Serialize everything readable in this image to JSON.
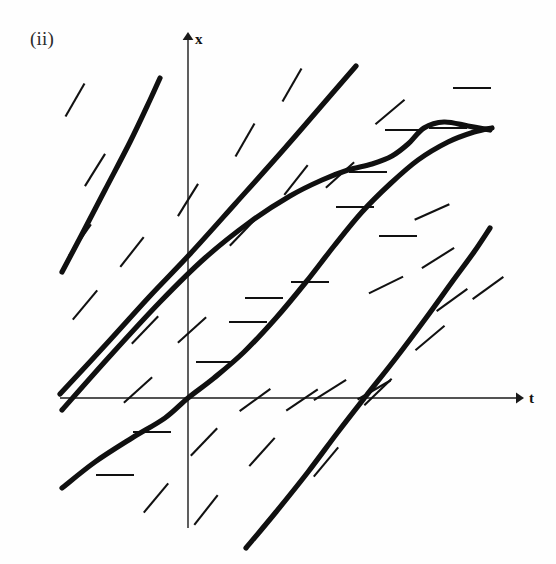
{
  "figure": {
    "panel_label": "(ii)",
    "type": "direction-field-with-solution-curves",
    "background_color": "#fefefe",
    "ink_color": "#111111"
  },
  "axes": {
    "horizontal": {
      "label": "t",
      "label_x": 530,
      "label_y": 402,
      "y_pixel": 398,
      "x_start": 60,
      "x_end": 520,
      "arrow": "right"
    },
    "vertical": {
      "label": "x",
      "label_x": 196,
      "label_y": 42,
      "x_pixel": 188,
      "y_start": 528,
      "y_end": 34,
      "arrow": "up"
    }
  },
  "chart_data": {
    "type": "line",
    "title": "(ii)",
    "xlabel": "t",
    "ylabel": "x",
    "grid": false,
    "legend": false,
    "axis_origin_pixel": [
      188,
      398
    ],
    "slope_marks": [
      {
        "x": 75,
        "y": 100,
        "angle": -60
      },
      {
        "x": 95,
        "y": 170,
        "angle": -58
      },
      {
        "x": 80,
        "y": 240,
        "angle": -55
      },
      {
        "x": 132,
        "y": 252,
        "angle": -52
      },
      {
        "x": 85,
        "y": 305,
        "angle": -50
      },
      {
        "x": 145,
        "y": 330,
        "angle": -46
      },
      {
        "x": 138,
        "y": 390,
        "angle": -42
      },
      {
        "x": 192,
        "y": 330,
        "angle": -42
      },
      {
        "x": 188,
        "y": 200,
        "angle": -58
      },
      {
        "x": 245,
        "y": 140,
        "angle": -60
      },
      {
        "x": 292,
        "y": 85,
        "angle": -60
      },
      {
        "x": 243,
        "y": 232,
        "angle": -46
      },
      {
        "x": 296,
        "y": 180,
        "angle": -52
      },
      {
        "x": 340,
        "y": 175,
        "angle": -42
      },
      {
        "x": 255,
        "y": 400,
        "angle": -36
      },
      {
        "x": 302,
        "y": 400,
        "angle": -34
      },
      {
        "x": 330,
        "y": 390,
        "angle": -32
      },
      {
        "x": 374,
        "y": 390,
        "angle": -30
      },
      {
        "x": 390,
        "y": 112,
        "angle": -40
      },
      {
        "x": 398,
        "y": 236,
        "angle": 0
      },
      {
        "x": 310,
        "y": 282,
        "angle": 0
      },
      {
        "x": 248,
        "y": 322,
        "angle": 0
      },
      {
        "x": 215,
        "y": 362,
        "angle": 0
      },
      {
        "x": 368,
        "y": 172,
        "angle": 0
      },
      {
        "x": 404,
        "y": 130,
        "angle": 0
      },
      {
        "x": 472,
        "y": 88,
        "angle": 0
      },
      {
        "x": 448,
        "y": 128,
        "angle": 0
      },
      {
        "x": 152,
        "y": 432,
        "angle": 0
      },
      {
        "x": 115,
        "y": 475,
        "angle": 0
      },
      {
        "x": 355,
        "y": 207,
        "angle": 0
      },
      {
        "x": 432,
        "y": 212,
        "angle": -24
      },
      {
        "x": 386,
        "y": 285,
        "angle": -26
      },
      {
        "x": 438,
        "y": 258,
        "angle": -32
      },
      {
        "x": 452,
        "y": 300,
        "angle": -36
      },
      {
        "x": 488,
        "y": 288,
        "angle": -36
      },
      {
        "x": 430,
        "y": 338,
        "angle": -40
      },
      {
        "x": 378,
        "y": 392,
        "angle": -44
      },
      {
        "x": 204,
        "y": 442,
        "angle": -46
      },
      {
        "x": 262,
        "y": 452,
        "angle": -48
      },
      {
        "x": 156,
        "y": 498,
        "angle": -50
      },
      {
        "x": 206,
        "y": 510,
        "angle": -52
      },
      {
        "x": 326,
        "y": 462,
        "angle": -50
      },
      {
        "x": 264,
        "y": 298,
        "angle": 0
      }
    ],
    "solution_curves": [
      {
        "name": "curve-1-far-left",
        "points": [
          [
            62,
            272
          ],
          [
            80,
            238
          ],
          [
            105,
            190
          ],
          [
            130,
            142
          ],
          [
            150,
            100
          ],
          [
            160,
            78
          ]
        ]
      },
      {
        "name": "curve-2-left-through-upper",
        "points": [
          [
            60,
            394
          ],
          [
            110,
            340
          ],
          [
            150,
            296
          ],
          [
            190,
            254
          ],
          [
            235,
            204
          ],
          [
            285,
            148
          ],
          [
            330,
            96
          ],
          [
            356,
            66
          ]
        ]
      },
      {
        "name": "curve-3-s-shaped-middle",
        "points": [
          [
            62,
            410
          ],
          [
            110,
            356
          ],
          [
            160,
            302
          ],
          [
            205,
            258
          ],
          [
            250,
            222
          ],
          [
            290,
            196
          ],
          [
            322,
            180
          ],
          [
            348,
            170
          ],
          [
            372,
            164
          ],
          [
            392,
            156
          ],
          [
            408,
            144
          ],
          [
            424,
            128
          ],
          [
            444,
            122
          ],
          [
            468,
            126
          ],
          [
            490,
            130
          ]
        ]
      },
      {
        "name": "curve-4-through-origin",
        "points": [
          [
            62,
            488
          ],
          [
            95,
            462
          ],
          [
            132,
            438
          ],
          [
            165,
            418
          ],
          [
            188,
            398
          ],
          [
            214,
            378
          ],
          [
            244,
            352
          ],
          [
            276,
            318
          ],
          [
            306,
            282
          ],
          [
            334,
            246
          ],
          [
            362,
            212
          ],
          [
            390,
            184
          ],
          [
            418,
            160
          ],
          [
            448,
            142
          ],
          [
            474,
            132
          ],
          [
            492,
            128
          ]
        ]
      },
      {
        "name": "curve-5-lower-right",
        "points": [
          [
            246,
            548
          ],
          [
            276,
            512
          ],
          [
            308,
            472
          ],
          [
            338,
            432
          ],
          [
            366,
            396
          ],
          [
            396,
            358
          ],
          [
            426,
            318
          ],
          [
            452,
            282
          ],
          [
            474,
            252
          ],
          [
            490,
            228
          ]
        ]
      }
    ]
  }
}
